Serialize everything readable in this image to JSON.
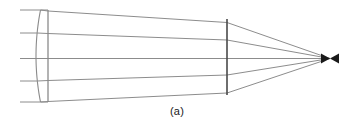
{
  "figure": {
    "caption": "(a)",
    "type": "optical-ray-diagram",
    "canvas": {
      "width": 354,
      "height": 132
    },
    "colors": {
      "background": "#ffffff",
      "ray_stroke": "#6e6e6e",
      "lens_stroke": "#8a8a8a",
      "stop_stroke": "#4a4a4a",
      "focus_fill": "#1a1a1a",
      "caption_text": "#1a1a1a"
    },
    "optical_axis_y": 58.5,
    "lens": {
      "name": "plano-convex-lens",
      "left_surface_x_vertex": 36.0,
      "left_surface_x_edge": 40.5,
      "right_surface_x": 48.0,
      "top_y": 10.0,
      "bottom_y": 102.0,
      "shape": "convex-left-flat-right"
    },
    "aperture_stop": {
      "name": "aperture-stop",
      "x": 227.0,
      "top_y": 19.0,
      "bottom_y": 95.0,
      "stroke_width": 1.6
    },
    "focal_point": {
      "name": "focal-point",
      "x": 330.0,
      "y": 58.5,
      "caustic_half_width": 9.0,
      "caustic_half_height": 5.0
    },
    "rays": [
      {
        "id": "ray-1-top",
        "entry_y": 10.0,
        "lens_exit_y": 11.0,
        "stop_y": 22.5,
        "focus_y": 58.5,
        "start_x": 20.0
      },
      {
        "id": "ray-2-upper",
        "entry_y": 33.0,
        "lens_exit_y": 33.5,
        "stop_y": 40.0,
        "focus_y": 58.5,
        "start_x": 20.0
      },
      {
        "id": "ray-3-axis",
        "entry_y": 58.5,
        "lens_exit_y": 58.5,
        "stop_y": 58.5,
        "focus_y": 58.5,
        "start_x": 20.0
      },
      {
        "id": "ray-4-lower",
        "entry_y": 81.0,
        "lens_exit_y": 80.5,
        "stop_y": 75.0,
        "focus_y": 58.5,
        "start_x": 20.0
      },
      {
        "id": "ray-5-bottom",
        "entry_y": 102.0,
        "lens_exit_y": 101.5,
        "stop_y": 93.0,
        "focus_y": 58.5,
        "start_x": 20.0
      }
    ],
    "ray_count": 5
  }
}
